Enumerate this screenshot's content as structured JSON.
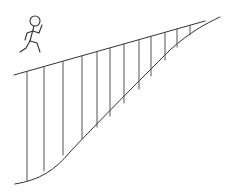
{
  "diagram": {
    "colors": {
      "line": "#333333",
      "background": "#ffffff"
    },
    "ramp_top_line": {
      "x1": 14,
      "y1": 75,
      "x2": 205,
      "y2": 21
    },
    "lower_curve": {
      "start": [
        15,
        184
      ],
      "end": [
        220,
        17
      ]
    },
    "hatch_lines_x": [
      27,
      44,
      63,
      82,
      97,
      110,
      124,
      139,
      151,
      165,
      177,
      190
    ],
    "figure": "running-stick-figure"
  }
}
